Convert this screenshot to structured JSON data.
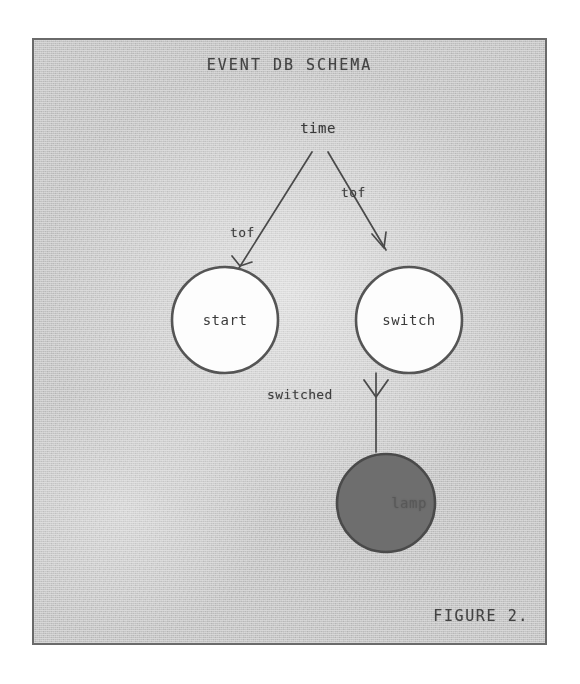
{
  "figure": {
    "title": "EVENT DB SCHEMA",
    "caption": "FIGURE 2.",
    "border_color": "#6a6a6a",
    "paper_color": "#d9d9d9",
    "ink_color": "#3a3a3a"
  },
  "nodes": [
    {
      "id": "time",
      "label": "time",
      "shape": "text",
      "fill": "none",
      "cx": 284,
      "cy": 90
    },
    {
      "id": "start",
      "label": "start",
      "shape": "circle",
      "fill": "#fdfdfd",
      "stroke": "#555555",
      "cx": 191,
      "cy": 280,
      "r": 53
    },
    {
      "id": "switch",
      "label": "switch",
      "shape": "circle",
      "fill": "#fdfdfd",
      "stroke": "#555555",
      "cx": 375,
      "cy": 280,
      "r": 53
    },
    {
      "id": "lamp",
      "label": "lamp",
      "shape": "circle",
      "fill": "#6e6e6e",
      "stroke": "#4a4a4a",
      "cx": 352,
      "cy": 463,
      "r": 49
    }
  ],
  "edges": [
    {
      "id": "start-time",
      "from": "start",
      "to": "time",
      "label": "tof",
      "arrow": "to-target"
    },
    {
      "id": "switch-time",
      "from": "switch",
      "to": "time",
      "label": "tof",
      "arrow": "to-target"
    },
    {
      "id": "switch-lamp",
      "from": "switch",
      "to": "lamp",
      "label": "switched",
      "arrow": "to-target"
    }
  ],
  "colors": {
    "paper": "#d9d9d9",
    "ink": "#3a3a3a",
    "frame": "#6a6a6a",
    "node_fill_light": "#fdfdfd",
    "node_fill_dark": "#6e6e6e",
    "page_background": "#ffffff"
  }
}
